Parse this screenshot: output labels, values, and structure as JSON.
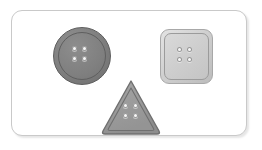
{
  "canvas": {
    "background_color": "#ffffff",
    "width": 262,
    "height": 150
  },
  "card": {
    "name": "button-collection-card",
    "background_color": "#ffffff",
    "border_color": "#c9c9c9",
    "corner_radius": "11px",
    "shadow": "rgba(0,0,0,0.10)"
  },
  "items": [
    {
      "id": "round-button",
      "shape": "circle",
      "label": "Round sewing button",
      "hole_count": 4,
      "body_color": "#7f7f7f",
      "rim_color": "#8e8e8e",
      "outline_color": "#5d5d5d",
      "hole_color": "#f7f7f7"
    },
    {
      "id": "square-button",
      "shape": "rounded-square",
      "label": "Square sewing button",
      "hole_count": 4,
      "body_color": "#cdcdcd",
      "rim_color": "#e3e3e3",
      "outline_color": "#a8a8a8",
      "hole_color": "#f7f7f7"
    },
    {
      "id": "triangle-button",
      "shape": "rounded-triangle",
      "label": "Triangle sewing button",
      "hole_count": 4,
      "body_color": "#9a9a9a",
      "rim_color": "#8a8a8a",
      "outline_color": "#6f6f6f",
      "hole_color": "#f7f7f7"
    }
  ]
}
